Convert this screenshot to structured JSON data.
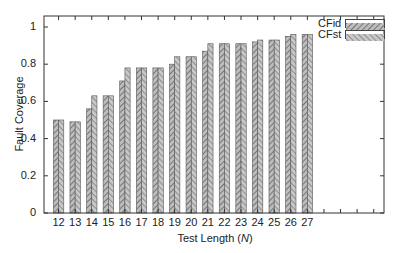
{
  "chart_data": {
    "type": "bar",
    "title": "",
    "xlabel": "Test Length (N)",
    "xlabel_parts": {
      "prefix": "Test Length (",
      "var": "N",
      "suffix": ")"
    },
    "ylabel": "Fault Coverage",
    "ylim": [
      0,
      1.06
    ],
    "yticks": [
      0,
      0.2,
      0.4,
      0.6,
      0.8,
      1
    ],
    "ytick_labels": [
      "0",
      "0.2",
      "0.4",
      "0.6",
      "0.8",
      "1"
    ],
    "categories": [
      "12",
      "13",
      "14",
      "15",
      "16",
      "17",
      "18",
      "19",
      "20",
      "21",
      "22",
      "23",
      "24",
      "25",
      "26",
      "27"
    ],
    "series": [
      {
        "name": "CFid",
        "values": [
          0.5,
          0.49,
          0.56,
          0.63,
          0.71,
          0.78,
          0.78,
          0.8,
          0.84,
          0.87,
          0.91,
          0.91,
          0.92,
          0.93,
          0.95,
          0.96
        ]
      },
      {
        "name": "CFst",
        "values": [
          0.5,
          0.49,
          0.63,
          0.63,
          0.78,
          0.78,
          0.78,
          0.84,
          0.84,
          0.91,
          0.91,
          0.91,
          0.93,
          0.93,
          0.96,
          0.96
        ]
      }
    ],
    "legend_position": "upper right",
    "grid": false,
    "bar_fill": "hatched gray",
    "x_extra_empty_slots": 4
  },
  "legend": {
    "items": [
      {
        "label": "CFid"
      },
      {
        "label": "CFst"
      }
    ]
  }
}
